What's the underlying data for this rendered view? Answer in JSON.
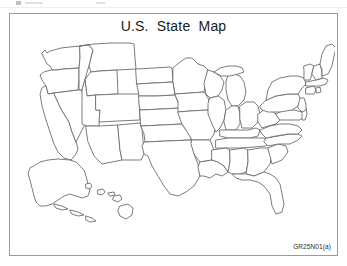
{
  "figure": {
    "title": "U.S.  State  Map",
    "catalog_code": "GR25N01(a)",
    "frame_color": "#9a9a9a",
    "background_color": "#ffffff",
    "outline_color": "#6d6d6d",
    "title_color": "#1a1a1a"
  },
  "map": {
    "name": "blank-us-state-map",
    "description": "Unlabeled outline map of the United States showing state boundaries",
    "projection_note": "contiguous 48 states with Alaska and Hawaii shown as insets at lower left",
    "regions": [
      {
        "code": "WA",
        "name": "Washington"
      },
      {
        "code": "OR",
        "name": "Oregon"
      },
      {
        "code": "CA",
        "name": "California"
      },
      {
        "code": "NV",
        "name": "Nevada"
      },
      {
        "code": "ID",
        "name": "Idaho"
      },
      {
        "code": "MT",
        "name": "Montana"
      },
      {
        "code": "WY",
        "name": "Wyoming"
      },
      {
        "code": "UT",
        "name": "Utah"
      },
      {
        "code": "AZ",
        "name": "Arizona"
      },
      {
        "code": "CO",
        "name": "Colorado"
      },
      {
        "code": "NM",
        "name": "New Mexico"
      },
      {
        "code": "ND",
        "name": "North Dakota"
      },
      {
        "code": "SD",
        "name": "South Dakota"
      },
      {
        "code": "NE",
        "name": "Nebraska"
      },
      {
        "code": "KS",
        "name": "Kansas"
      },
      {
        "code": "OK",
        "name": "Oklahoma"
      },
      {
        "code": "TX",
        "name": "Texas"
      },
      {
        "code": "MN",
        "name": "Minnesota"
      },
      {
        "code": "IA",
        "name": "Iowa"
      },
      {
        "code": "MO",
        "name": "Missouri"
      },
      {
        "code": "AR",
        "name": "Arkansas"
      },
      {
        "code": "LA",
        "name": "Louisiana"
      },
      {
        "code": "WI",
        "name": "Wisconsin"
      },
      {
        "code": "IL",
        "name": "Illinois"
      },
      {
        "code": "MI",
        "name": "Michigan"
      },
      {
        "code": "IN",
        "name": "Indiana"
      },
      {
        "code": "OH",
        "name": "Ohio"
      },
      {
        "code": "KY",
        "name": "Kentucky"
      },
      {
        "code": "TN",
        "name": "Tennessee"
      },
      {
        "code": "MS",
        "name": "Mississippi"
      },
      {
        "code": "AL",
        "name": "Alabama"
      },
      {
        "code": "GA",
        "name": "Georgia"
      },
      {
        "code": "FL",
        "name": "Florida"
      },
      {
        "code": "SC",
        "name": "South Carolina"
      },
      {
        "code": "NC",
        "name": "North Carolina"
      },
      {
        "code": "VA",
        "name": "Virginia"
      },
      {
        "code": "WV",
        "name": "West Virginia"
      },
      {
        "code": "MD",
        "name": "Maryland"
      },
      {
        "code": "DE",
        "name": "Delaware"
      },
      {
        "code": "NJ",
        "name": "New Jersey"
      },
      {
        "code": "PA",
        "name": "Pennsylvania"
      },
      {
        "code": "NY",
        "name": "New York"
      },
      {
        "code": "CT",
        "name": "Connecticut"
      },
      {
        "code": "RI",
        "name": "Rhode Island"
      },
      {
        "code": "MA",
        "name": "Massachusetts"
      },
      {
        "code": "VT",
        "name": "Vermont"
      },
      {
        "code": "NH",
        "name": "New Hampshire"
      },
      {
        "code": "ME",
        "name": "Maine"
      },
      {
        "code": "AK",
        "name": "Alaska"
      },
      {
        "code": "HI",
        "name": "Hawaii"
      }
    ]
  }
}
